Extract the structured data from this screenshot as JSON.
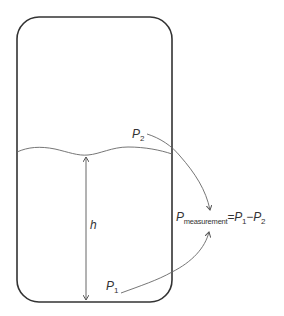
{
  "diagram": {
    "tank": {
      "shape": "rounded-rectangle",
      "stroke_color": "#333333"
    },
    "liquid_surface": {
      "shape": "wavy-line"
    },
    "labels": {
      "p2": {
        "base": "P",
        "sub": "2"
      },
      "p1": {
        "base": "P",
        "sub": "1"
      },
      "h": "h",
      "formula": {
        "lhs_base": "P",
        "lhs_sub": "measurement",
        "equals": "=",
        "term1_base": "P",
        "term1_sub": "1",
        "minus": "−",
        "term2_base": "P",
        "term2_sub": "2"
      }
    },
    "arrows": [
      {
        "from": "P2 (above liquid)",
        "to": "formula"
      },
      {
        "from": "P1 (tank bottom)",
        "to": "formula"
      },
      {
        "from": "tank bottom",
        "to": "liquid surface",
        "label": "h",
        "double_headed": true
      }
    ],
    "colors": {
      "outline": "#333333",
      "thin_line": "#666666",
      "text": "#333333",
      "background": "#ffffff"
    }
  }
}
